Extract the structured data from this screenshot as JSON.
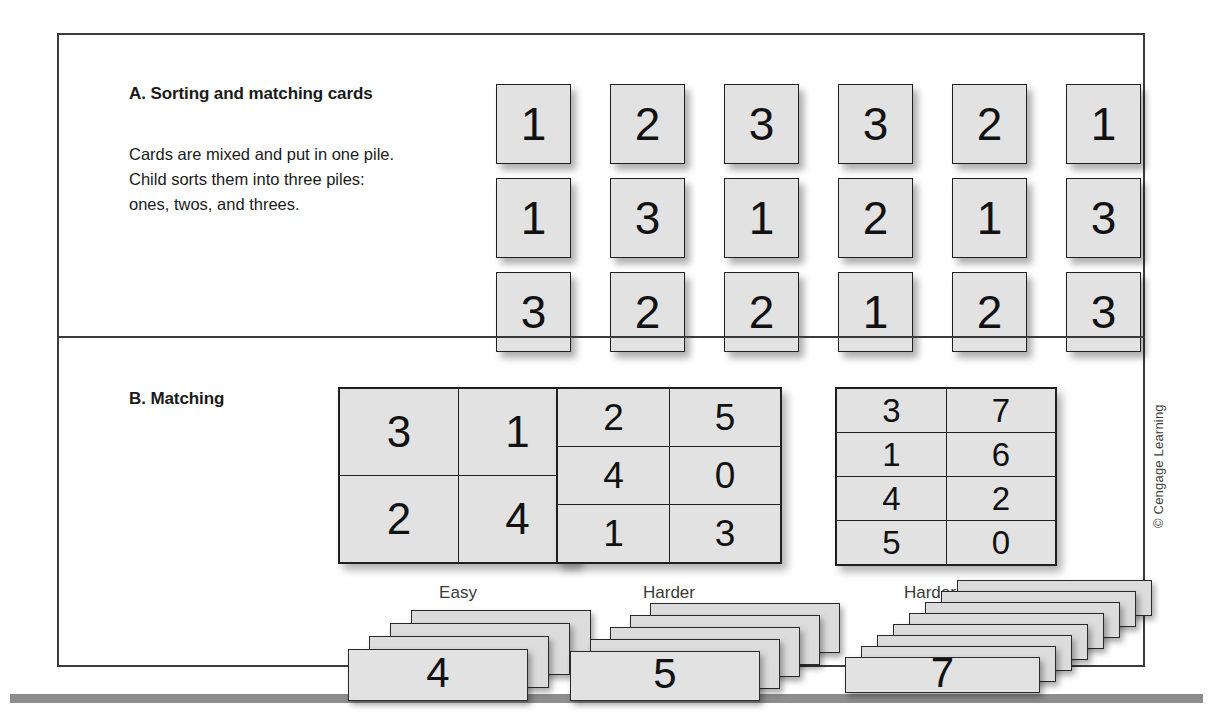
{
  "figure": {
    "copyright": "© Cengage Learning"
  },
  "panel_a": {
    "heading": "A. Sorting and matching cards",
    "description_lines": [
      "Cards are mixed and put in one pile.",
      "Child sorts them into three piles:",
      "ones, twos, and threes."
    ],
    "card_grid": {
      "rows": 3,
      "columns": 6,
      "values": [
        [
          "1",
          "2",
          "3",
          "3",
          "2",
          "1"
        ],
        [
          "1",
          "3",
          "1",
          "2",
          "1",
          "3"
        ],
        [
          "3",
          "2",
          "2",
          "1",
          "2",
          "3"
        ]
      ]
    }
  },
  "panel_b": {
    "heading": "B. Matching",
    "groups": [
      {
        "label": "Easy",
        "grid": {
          "rows": 2,
          "columns": 2,
          "values": [
            [
              "3",
              "1"
            ],
            [
              "2",
              "4"
            ]
          ]
        },
        "stack": {
          "count": 4,
          "front_value": "4"
        }
      },
      {
        "label": "Harder",
        "grid": {
          "rows": 3,
          "columns": 2,
          "values": [
            [
              "2",
              "5"
            ],
            [
              "4",
              "0"
            ],
            [
              "1",
              "3"
            ]
          ]
        },
        "stack": {
          "count": 5,
          "front_value": "5"
        }
      },
      {
        "label": "Harder Still",
        "grid": {
          "rows": 4,
          "columns": 2,
          "values": [
            [
              "3",
              "7"
            ],
            [
              "1",
              "6"
            ],
            [
              "4",
              "2"
            ],
            [
              "5",
              "0"
            ]
          ]
        },
        "stack": {
          "count": 8,
          "front_value": "7"
        }
      }
    ]
  },
  "colors": {
    "card_fill": "#e2e2e2",
    "card_border": "#1f1f1f",
    "frame_border": "#3b3b3b",
    "text": "#1a1a1a",
    "label_text": "#3a3a3a",
    "bottom_rule": "#8d8d8d"
  }
}
